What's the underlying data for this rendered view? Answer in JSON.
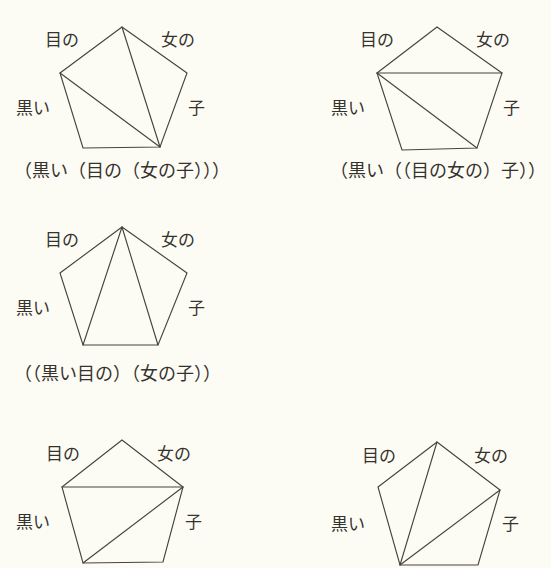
{
  "page": {
    "background_color": "#fdfcf4",
    "ink_color": "#46443c",
    "text_color": "#35332e",
    "width": 551,
    "height": 568
  },
  "edge_labels": {
    "top_left": "目の",
    "top_right": "女の",
    "left": "黒い",
    "right": "子"
  },
  "figures": [
    {
      "id": "figure-1",
      "position": {
        "x": 0,
        "y": 10
      },
      "caption": "（黒い（目の（女の子）））",
      "vertices": {
        "apex": [
          122,
          27
        ],
        "left": [
          60,
          73
        ],
        "right": [
          187,
          73
        ],
        "bottom_left": [
          83,
          148
        ],
        "bottom_right": [
          160,
          147
        ]
      },
      "internal_edges": [
        [
          "apex",
          "bottom_right"
        ],
        [
          "left",
          "bottom_right"
        ]
      ],
      "labels": {
        "top_left": {
          "x": 45,
          "y": 32
        },
        "top_right": {
          "x": 161,
          "y": 32
        },
        "left": {
          "x": 16,
          "y": 100
        },
        "right": {
          "x": 188,
          "y": 100
        }
      }
    },
    {
      "id": "figure-2",
      "position": {
        "x": 316,
        "y": 10
      },
      "caption": "（黒い（（目の女の）子））",
      "vertices": {
        "apex": [
          437,
          27
        ],
        "left": [
          377,
          73
        ],
        "right": [
          502,
          73
        ],
        "bottom_left": [
          402,
          150
        ],
        "bottom_right": [
          477,
          148
        ]
      },
      "internal_edges": [
        [
          "left",
          "right"
        ],
        [
          "left",
          "bottom_right"
        ]
      ],
      "labels": {
        "top_left": {
          "x": 360,
          "y": 32
        },
        "top_right": {
          "x": 476,
          "y": 32
        },
        "left": {
          "x": 331,
          "y": 100
        },
        "right": {
          "x": 503,
          "y": 100
        }
      }
    },
    {
      "id": "figure-3",
      "position": {
        "x": 0,
        "y": 212
      },
      "caption": "（（黒い目の）（女の子））",
      "vertices": {
        "apex": [
          122,
          227
        ],
        "left": [
          60,
          273
        ],
        "right": [
          187,
          273
        ],
        "bottom_left": [
          83,
          345
        ],
        "bottom_right": [
          158,
          345
        ]
      },
      "internal_edges": [
        [
          "apex",
          "bottom_left"
        ],
        [
          "apex",
          "bottom_right"
        ]
      ],
      "labels": {
        "top_left": {
          "x": 45,
          "y": 232
        },
        "top_right": {
          "x": 161,
          "y": 232
        },
        "left": {
          "x": 16,
          "y": 300
        },
        "right": {
          "x": 188,
          "y": 300
        }
      }
    },
    {
      "id": "figure-4",
      "position": {
        "x": 0,
        "y": 425
      },
      "caption": "",
      "vertices": {
        "apex": [
          122,
          440
        ],
        "left": [
          62,
          487
        ],
        "right": [
          183,
          487
        ],
        "bottom_left": [
          83,
          563
        ],
        "bottom_right": [
          163,
          562
        ]
      },
      "internal_edges": [
        [
          "left",
          "right"
        ],
        [
          "bottom_left",
          "right"
        ]
      ],
      "labels": {
        "top_left": {
          "x": 46,
          "y": 446
        },
        "top_right": {
          "x": 157,
          "y": 446
        },
        "left": {
          "x": 16,
          "y": 514
        },
        "right": {
          "x": 185,
          "y": 514
        }
      }
    },
    {
      "id": "figure-5",
      "position": {
        "x": 316,
        "y": 425
      },
      "caption": "",
      "vertices": {
        "apex": [
          437,
          442
        ],
        "left": [
          378,
          487
        ],
        "right": [
          500,
          490
        ],
        "bottom_left": [
          400,
          565
        ],
        "bottom_right": [
          478,
          565
        ]
      },
      "internal_edges": [
        [
          "bottom_left",
          "apex"
        ],
        [
          "bottom_left",
          "right"
        ]
      ],
      "labels": {
        "top_left": {
          "x": 362,
          "y": 448
        },
        "top_right": {
          "x": 474,
          "y": 448
        },
        "left": {
          "x": 331,
          "y": 516
        },
        "right": {
          "x": 502,
          "y": 516
        }
      }
    }
  ],
  "captions": [
    {
      "text": "（黒い（目の（女の子）））",
      "x": 14,
      "y": 162
    },
    {
      "text": "（黒い（（目の女の）子））",
      "x": 330,
      "y": 162
    },
    {
      "text": "（（黒い目の）（女の子））",
      "x": 14,
      "y": 365
    }
  ]
}
